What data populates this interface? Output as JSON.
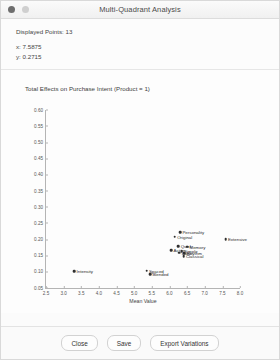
{
  "window": {
    "title": "Multi-Quadrant Analysis",
    "controls": [
      {
        "name": "close-dot",
        "color": "#6e6e6e"
      },
      {
        "name": "minimize-dot",
        "color": "#cfcfcf"
      }
    ]
  },
  "info": {
    "displayed_points_label": "Displayed Points: 13",
    "x_readout": "x: 7.5875",
    "y_readout": "y: 0.2715"
  },
  "footer": {
    "close_label": "Close",
    "save_label": "Save",
    "export_label": "Export Variations"
  },
  "chart_data": {
    "type": "scatter",
    "title": "Total Effects on Purchase Intent (Product = 1)",
    "xlabel": "Mean Value",
    "ylabel": "",
    "xlim": [
      2.5,
      8.0
    ],
    "ylim": [
      0.05,
      0.6
    ],
    "grid": false,
    "legend": "none",
    "xticks": [
      "2.5",
      "3.0",
      "3.5",
      "4.0",
      "4.5",
      "5.0",
      "5.5",
      "6.0",
      "6.5",
      "7.0",
      "7.5",
      "8.0"
    ],
    "yticks": [
      "0.05",
      "0.10",
      "0.15",
      "0.20",
      "0.25",
      "0.30",
      "0.35",
      "0.40",
      "0.45",
      "0.50",
      "0.55",
      "0.60"
    ],
    "points": [
      {
        "label": "Personality",
        "x": 6.3,
        "y": 0.222
      },
      {
        "label": "Original",
        "x": 6.15,
        "y": 0.207
      },
      {
        "label": "Extensive",
        "x": 7.59,
        "y": 0.2
      },
      {
        "label": "Quick",
        "x": 6.25,
        "y": 0.178
      },
      {
        "label": "Memory",
        "x": 6.5,
        "y": 0.176
      },
      {
        "label": "Active",
        "x": 6.05,
        "y": 0.165
      },
      {
        "label": "Simple",
        "x": 6.35,
        "y": 0.163
      },
      {
        "label": "Logic",
        "x": 6.28,
        "y": 0.158
      },
      {
        "label": "Rhythm",
        "x": 6.42,
        "y": 0.156
      },
      {
        "label": "Classical",
        "x": 6.4,
        "y": 0.148
      },
      {
        "label": "Intensity",
        "x": 3.3,
        "y": 0.1
      },
      {
        "label": "Spaced",
        "x": 5.35,
        "y": 0.102
      },
      {
        "label": "Blended",
        "x": 5.45,
        "y": 0.092
      }
    ]
  }
}
